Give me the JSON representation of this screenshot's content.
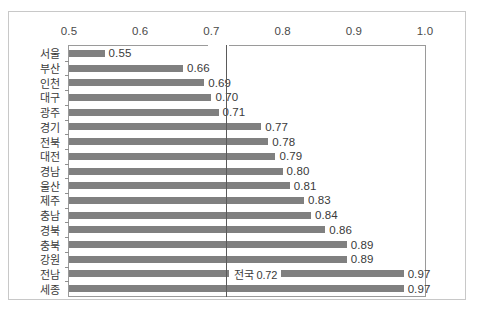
{
  "chart_data": {
    "type": "bar",
    "orientation": "horizontal",
    "title": "",
    "subtitle": "",
    "xlabel": "",
    "ylabel": "",
    "xlim": [
      0.5,
      1.0
    ],
    "xticks": [
      "0.5",
      "0.6",
      "0.7",
      "0.8",
      "0.9",
      "1.0"
    ],
    "xtick_values": [
      0.5,
      0.6,
      0.7,
      0.8,
      0.9,
      1.0
    ],
    "grid": false,
    "legend": null,
    "bar_color": "#808080",
    "categories": [
      "서울",
      "부산",
      "인천",
      "대구",
      "광주",
      "경기",
      "전북",
      "대전",
      "경남",
      "울산",
      "제주",
      "충남",
      "경북",
      "충북",
      "강원",
      "전남",
      "세종"
    ],
    "values": [
      0.55,
      0.66,
      0.69,
      0.7,
      0.71,
      0.77,
      0.78,
      0.79,
      0.8,
      0.81,
      0.83,
      0.84,
      0.86,
      0.89,
      0.89,
      0.97,
      0.97
    ],
    "value_labels": [
      "0.55",
      "0.66",
      "0.69",
      "0.70",
      "0.71",
      "0.77",
      "0.78",
      "0.79",
      "0.80",
      "0.81",
      "0.83",
      "0.84",
      "0.86",
      "0.89",
      "0.89",
      "0.97",
      "0.97"
    ],
    "annotations": [
      {
        "name": "national-average",
        "label": "전국 0.72",
        "value": 0.72,
        "type": "reference-line",
        "line_color": "#5a5a5a"
      }
    ]
  }
}
